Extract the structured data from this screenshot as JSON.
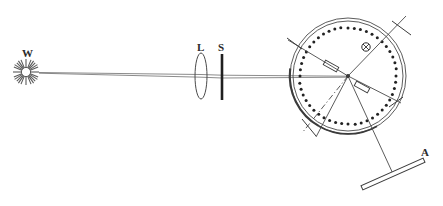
{
  "figure": {
    "kind": "optical-diagram",
    "title": "",
    "background_color": "#ffffff",
    "ink_color": "#4a4a4a",
    "dark_ink_color": "#2b2b2b",
    "width": 443,
    "height": 206
  },
  "labels": {
    "source": "W",
    "lens": "L",
    "slit": "S",
    "analyzer": "A"
  },
  "components": [
    {
      "id": "source",
      "label": "W",
      "icon": "starburst-icon",
      "description": "white light source",
      "cx": 26,
      "cy": 72,
      "radius": 13,
      "rays": 16,
      "label_x": 22,
      "label_y": 56
    },
    {
      "id": "lens",
      "label": "L",
      "icon": "lens-icon",
      "description": "collimating lens",
      "cx": 201,
      "cy": 76,
      "rx": 6,
      "ry": 23,
      "label_x": 197,
      "label_y": 50
    },
    {
      "id": "slit",
      "label": "S",
      "icon": "slit-icon",
      "description": "slit aperture",
      "x": 222,
      "y_top": 54,
      "y_bottom": 100,
      "label_x": 219,
      "label_y": 50
    },
    {
      "id": "circular-scale",
      "label": "",
      "icon": "graduated-circle-icon",
      "description": "graduated circular scale of spectrometer",
      "cx": 348,
      "cy": 76,
      "outer_radius": 58,
      "inner_radius": 55,
      "tick_count": 48,
      "tick_radius": 48,
      "tick_size": 1.5
    },
    {
      "id": "adjust-screw",
      "label": "",
      "icon": "crossed-circle-icon",
      "description": "adjusting screw on telescope arm",
      "cx": 366,
      "cy": 47,
      "radius": 4
    },
    {
      "id": "analyzer",
      "label": "A",
      "icon": "analyzer-plate-icon",
      "description": "analyzer plate / screen",
      "x1": 363,
      "y1": 188,
      "x2": 424,
      "y2": 160,
      "thickness": 4,
      "label_x": 424,
      "label_y": 154
    }
  ],
  "light_path": {
    "description": "beam from source through lens and slit to scale centre",
    "ray_upper": [
      [
        39,
        72
      ],
      [
        201,
        74
      ],
      [
        222,
        75
      ],
      [
        346,
        76
      ]
    ],
    "ray_lower": [
      [
        39,
        73
      ],
      [
        201,
        77
      ],
      [
        222,
        78
      ],
      [
        346,
        77
      ]
    ],
    "axis_left": [
      [
        39,
        73
      ],
      [
        290,
        76
      ]
    ]
  },
  "arms": [
    {
      "id": "arm-upper-right",
      "from": [
        348,
        76
      ],
      "to": [
        404,
        17
      ],
      "style": "solid",
      "description": "telescope arm toward upper right, extends past scale"
    },
    {
      "id": "arm-upper-left",
      "from": [
        348,
        76
      ],
      "to": [
        290,
        42
      ],
      "style": "solid",
      "description": "arm toward upper left, extends past scale"
    },
    {
      "id": "arm-lower-right",
      "from": [
        348,
        76
      ],
      "to": [
        393,
        174
      ],
      "style": "solid",
      "description": "arm toward analyzer plate A"
    },
    {
      "id": "arm-lower-left",
      "from": [
        348,
        76
      ],
      "to": [
        303,
        131
      ],
      "style": "dash-dot",
      "description": "optical axis reference, dash-dot"
    },
    {
      "id": "arm-lower-left-solid",
      "from": [
        348,
        76
      ],
      "to": [
        317,
        136
      ],
      "style": "solid",
      "description": "arm toward lower left crossing scale"
    },
    {
      "id": "arm-right-mid",
      "from": [
        348,
        76
      ],
      "to": [
        400,
        102
      ],
      "style": "solid",
      "description": "arm toward right, meets scale edge"
    }
  ],
  "center_fittings": [
    {
      "id": "vernier-left",
      "description": "small rectangular vernier block upper-left of centre",
      "cx": 331,
      "cy": 66,
      "w": 15,
      "h": 5,
      "rotate": 29
    },
    {
      "id": "vernier-right",
      "description": "small rectangular vernier block lower-right of centre",
      "cx": 362,
      "cy": 86,
      "w": 15,
      "h": 5,
      "rotate": 29
    }
  ],
  "edge_marks": [
    {
      "id": "mark-upper-right",
      "x1": 393,
      "y1": 22,
      "x2": 410,
      "y2": 34,
      "description": "index mark outside scale, upper right"
    },
    {
      "id": "mark-upper-left",
      "x1": 288,
      "y1": 39,
      "x2": 301,
      "y2": 48,
      "description": "index mark outside scale, upper left"
    },
    {
      "id": "mark-lower-left",
      "x1": 303,
      "y1": 120,
      "x2": 315,
      "y2": 135,
      "description": "index mark outside scale, lower left"
    },
    {
      "id": "mark-lower-right",
      "x1": 390,
      "y1": 106,
      "x2": 402,
      "y2": 98,
      "description": "index mark outside scale, right"
    }
  ],
  "scale_band": {
    "id": "scale-band-bottom",
    "description": "slightly thicker arc segment along lower-left of scale",
    "start_angle": 120,
    "end_angle": 250
  }
}
